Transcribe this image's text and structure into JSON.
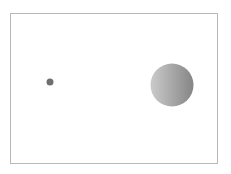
{
  "diagram": {
    "frame": {
      "x": 10,
      "y": 13,
      "width": 207,
      "height": 150,
      "border_color": "#b8b8b8"
    },
    "small_body": {
      "cx": 50,
      "cy": 82,
      "r": 3.5,
      "color": "#6f6f6f"
    },
    "large_body": {
      "cx": 172,
      "cy": 85,
      "r": 21.5,
      "gradient_light": "#c8c8c8",
      "gradient_dark": "#8a8a8a"
    }
  }
}
